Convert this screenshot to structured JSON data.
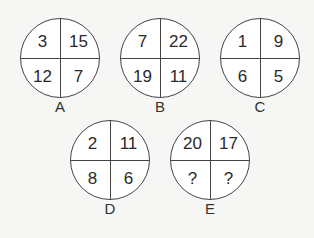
{
  "puzzle": {
    "circles": [
      {
        "label": "A",
        "top_left": "3",
        "top_right": "15",
        "bottom_left": "12",
        "bottom_right": "7"
      },
      {
        "label": "B",
        "top_left": "7",
        "top_right": "22",
        "bottom_left": "19",
        "bottom_right": "11"
      },
      {
        "label": "C",
        "top_left": "1",
        "top_right": "9",
        "bottom_left": "6",
        "bottom_right": "5"
      },
      {
        "label": "D",
        "top_left": "2",
        "top_right": "11",
        "bottom_left": "8",
        "bottom_right": "6"
      },
      {
        "label": "E",
        "top_left": "20",
        "top_right": "17",
        "bottom_left": "?",
        "bottom_right": "?"
      }
    ]
  }
}
